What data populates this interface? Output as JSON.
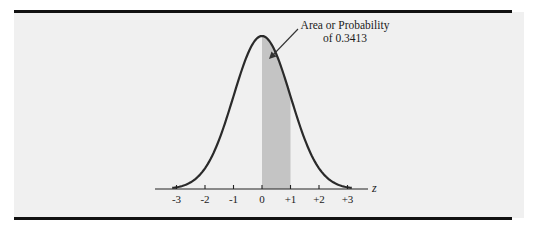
{
  "chart_data": {
    "type": "area",
    "title": "",
    "subtitle": "",
    "xlabel": "z",
    "ylabel": "",
    "distribution": "standard normal",
    "x_ticks": [
      -3,
      -2,
      -1,
      0,
      1,
      2,
      3
    ],
    "x_tick_labels": [
      "-3",
      "-2",
      "-1",
      "0",
      "+1",
      "+2",
      "+3"
    ],
    "xlim": [
      -3.3,
      3.6
    ],
    "shaded_region": {
      "from": 0,
      "to": 1,
      "probability": 0.3413
    },
    "annotation": {
      "line1": "Area or Probability",
      "line2": "of 0.3413"
    },
    "grid": false,
    "legend": null
  },
  "colors": {
    "panel_background": "#f0f0f0",
    "rule": "#111111",
    "curve": "#2a2a2a",
    "shade": "#c4c4c4",
    "axis": "#222222",
    "text": "#1a1a1a"
  }
}
